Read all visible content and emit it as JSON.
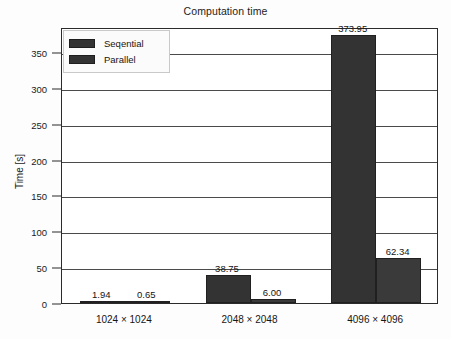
{
  "chart_data": {
    "type": "bar",
    "title": "Computation time",
    "xlabel": "",
    "ylabel": "Time [s]",
    "categories": [
      "1024 × 1024",
      "2048 × 2048",
      "4096 × 4096"
    ],
    "series": [
      {
        "name": "Seqential",
        "values": [
          1.94,
          38.75,
          373.95
        ],
        "color": "#333333"
      },
      {
        "name": "Parallel",
        "values": [
          0.65,
          6.0,
          62.34
        ],
        "color": "#3a3a3a"
      }
    ],
    "value_labels": [
      [
        "1.94",
        "0.65"
      ],
      [
        "38.75",
        "6.00"
      ],
      [
        "373.95",
        "62.34"
      ]
    ],
    "ylim": [
      0,
      385
    ],
    "yticks": [
      0,
      50,
      100,
      150,
      200,
      250,
      300,
      350
    ],
    "ytick_labels": [
      "0",
      "50",
      "100",
      "150",
      "200",
      "250",
      "300",
      "350"
    ],
    "grid": true,
    "grid_axis": "y",
    "legend_position": "upper left"
  },
  "legend": {
    "entries": [
      {
        "label": "Seqential",
        "swatch": "legend-swatch-seqential"
      },
      {
        "label": "Parallel",
        "swatch": "legend-swatch-parallel"
      }
    ]
  }
}
